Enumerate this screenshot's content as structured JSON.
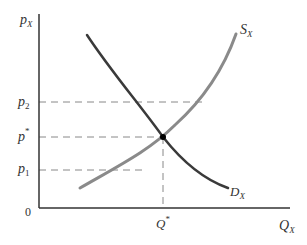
{
  "diagram": {
    "type": "supply-demand",
    "axes": {
      "y_label": "p",
      "y_label_sub": "X",
      "x_label": "Q",
      "x_label_sub": "X",
      "origin": "0"
    },
    "price_levels": [
      {
        "label": "p",
        "sub": "2",
        "sup": ""
      },
      {
        "label": "p",
        "sub": "",
        "sup": "*"
      },
      {
        "label": "p",
        "sub": "1",
        "sup": ""
      }
    ],
    "quantity_marker": {
      "label": "Q",
      "sup": "*"
    },
    "curves": {
      "supply": {
        "label": "S",
        "sub": "X",
        "color": "#8a8a8a"
      },
      "demand": {
        "label": "D",
        "sub": "X",
        "color": "#3a3a3a"
      }
    },
    "equilibrium_point": {
      "label": "equilibrium",
      "color": "#000000"
    }
  }
}
